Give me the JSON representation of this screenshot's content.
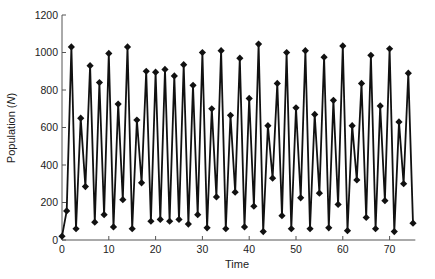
{
  "chart_data": {
    "type": "line",
    "title": "",
    "xlabel": "Time",
    "ylabel": "Population (N)",
    "ylabel_parts": {
      "prefix": "Population (",
      "italic": "N",
      "suffix": ")"
    },
    "xlim": [
      0,
      75.5
    ],
    "ylim": [
      0,
      1200
    ],
    "xticks": [
      0,
      10,
      20,
      30,
      40,
      50,
      60,
      70
    ],
    "yticks": [
      0,
      200,
      400,
      600,
      800,
      1000,
      1200
    ],
    "grid": false,
    "legend": null,
    "marker": "diamond",
    "line_color": "#111111",
    "marker_color": "#111111",
    "series": [
      {
        "name": "Population",
        "x": [
          0,
          1,
          2,
          3,
          4,
          5,
          6,
          7,
          8,
          9,
          10,
          11,
          12,
          13,
          14,
          15,
          16,
          17,
          18,
          19,
          20,
          21,
          22,
          23,
          24,
          25,
          26,
          27,
          28,
          29,
          30,
          31,
          32,
          33,
          34,
          35,
          36,
          37,
          38,
          39,
          40,
          41,
          42,
          43,
          44,
          45,
          46,
          47,
          48,
          49,
          50,
          51,
          52,
          53,
          54,
          55,
          56,
          57,
          58,
          59,
          60,
          61,
          62,
          63,
          64,
          65,
          66,
          67,
          68,
          69,
          70,
          71,
          72,
          73,
          74,
          75
        ],
        "values": [
          20,
          155,
          1030,
          60,
          650,
          285,
          930,
          95,
          840,
          135,
          995,
          70,
          725,
          215,
          1030,
          60,
          640,
          305,
          900,
          100,
          895,
          110,
          910,
          100,
          875,
          110,
          935,
          85,
          825,
          135,
          1000,
          65,
          700,
          230,
          1010,
          60,
          665,
          255,
          970,
          70,
          755,
          180,
          1045,
          45,
          610,
          330,
          835,
          130,
          1000,
          60,
          705,
          225,
          1010,
          60,
          670,
          250,
          975,
          65,
          745,
          190,
          1035,
          50,
          610,
          320,
          835,
          120,
          985,
          60,
          715,
          210,
          1020,
          45,
          630,
          300,
          890,
          90
        ]
      }
    ]
  }
}
